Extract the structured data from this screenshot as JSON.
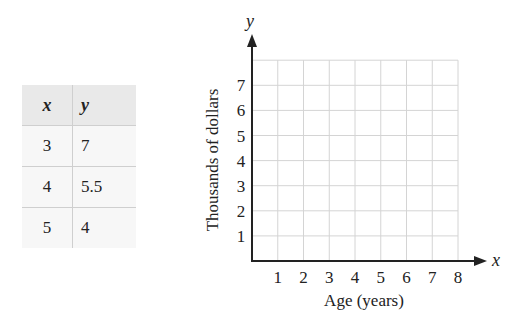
{
  "table": {
    "headers": [
      "x",
      "y"
    ],
    "rows": [
      [
        "3",
        "7"
      ],
      [
        "4",
        "5.5"
      ],
      [
        "5",
        "4"
      ]
    ]
  },
  "graph": {
    "x_axis_letter": "x",
    "y_axis_letter": "y",
    "xlabel": "Age (years)",
    "ylabel": "Thousands of dollars",
    "x_ticks": [
      "1",
      "2",
      "3",
      "4",
      "5",
      "6",
      "7",
      "8"
    ],
    "y_ticks": [
      "1",
      "2",
      "3",
      "4",
      "5",
      "6",
      "7"
    ]
  },
  "chart_data": {
    "type": "table",
    "title": "",
    "table": {
      "columns": [
        "x",
        "y"
      ],
      "rows": [
        [
          3,
          7
        ],
        [
          4,
          5.5
        ],
        [
          5,
          4
        ]
      ]
    },
    "axes": {
      "xlabel": "Age (years)",
      "ylabel": "Thousands of dollars",
      "xlim": [
        0,
        8
      ],
      "ylim": [
        0,
        8
      ],
      "x_ticks": [
        1,
        2,
        3,
        4,
        5,
        6,
        7,
        8
      ],
      "y_ticks": [
        1,
        2,
        3,
        4,
        5,
        6,
        7
      ],
      "grid": true,
      "plotted_points": []
    }
  }
}
